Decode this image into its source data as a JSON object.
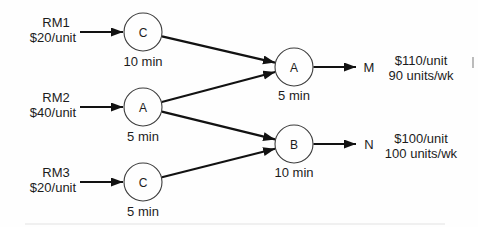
{
  "diagram": {
    "type": "process-flow",
    "inputs": [
      {
        "name": "RM1",
        "cost": "$20/unit",
        "feeds_station": "C1"
      },
      {
        "name": "RM2",
        "cost": "$40/unit",
        "feeds_station": "A1"
      },
      {
        "name": "RM3",
        "cost": "$20/unit",
        "feeds_station": "C2"
      }
    ],
    "stations": [
      {
        "id": "C1",
        "label": "C",
        "time": "10 min"
      },
      {
        "id": "A1",
        "label": "A",
        "time": "5 min"
      },
      {
        "id": "C2",
        "label": "C",
        "time": "5 min"
      },
      {
        "id": "A2",
        "label": "A",
        "time": "5 min"
      },
      {
        "id": "B2",
        "label": "B",
        "time": "10 min"
      }
    ],
    "edges": [
      {
        "from": "C1",
        "to": "A2"
      },
      {
        "from": "A1",
        "to": "A2"
      },
      {
        "from": "A1",
        "to": "B2"
      },
      {
        "from": "C2",
        "to": "B2"
      }
    ],
    "outputs": [
      {
        "product": "M",
        "price": "$110/unit",
        "demand": "90 units/wk",
        "from_station": "A2"
      },
      {
        "product": "N",
        "price": "$100/unit",
        "demand": "100 units/wk",
        "from_station": "B2"
      }
    ],
    "colors": {
      "ink": "#1c1c1c",
      "background": "#fefefe"
    }
  }
}
